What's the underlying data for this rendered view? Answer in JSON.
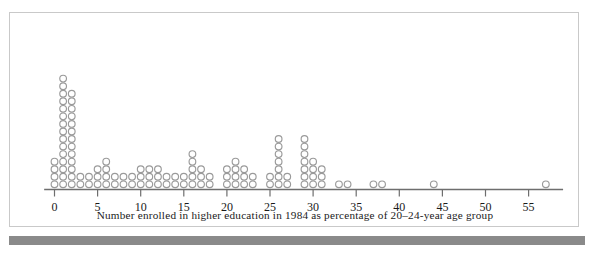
{
  "figure": {
    "caption": "Number enrolled in higher education in 1984 as percentage of 20–24-year age group",
    "frame_color": "#c9c9c9",
    "axis_color": "#6e6e6e",
    "dot_color": "#9a9a9a",
    "bottom_bar_color": "#8a8a8a",
    "background_color": "#ffffff"
  },
  "chart_data": {
    "type": "scatter",
    "plot_style": "dot-plot",
    "title": "",
    "subtitle": "",
    "xlabel": "Number enrolled in higher education in 1984 as percentage of 20–24-year age group",
    "ylabel": "",
    "xlim": [
      -1.2,
      59
    ],
    "ylim": [
      0,
      16
    ],
    "grid": false,
    "legend": null,
    "tick_labels": [
      "0",
      "5",
      "10",
      "15",
      "20",
      "25",
      "30",
      "35",
      "40",
      "45",
      "50",
      "55"
    ],
    "tick_values": [
      0,
      5,
      10,
      15,
      20,
      25,
      30,
      35,
      40,
      45,
      50,
      55
    ],
    "tick_interval": 5,
    "dot_unit": 1,
    "total_dots": 105,
    "categories": [
      0,
      1,
      2,
      3,
      4,
      5,
      6,
      7,
      8,
      9,
      10,
      11,
      12,
      13,
      14,
      15,
      16,
      17,
      18,
      19,
      20,
      21,
      22,
      23,
      24,
      25,
      26,
      27,
      28,
      29,
      30,
      31,
      32,
      33,
      34,
      35,
      36,
      37,
      38,
      39,
      40,
      41,
      42,
      43,
      44,
      45,
      46,
      47,
      48,
      49,
      50,
      51,
      52,
      53,
      54,
      55,
      56,
      57
    ],
    "values": [
      4,
      15,
      13,
      2,
      2,
      3,
      4,
      2,
      2,
      2,
      3,
      3,
      3,
      2,
      2,
      2,
      5,
      3,
      2,
      0,
      3,
      4,
      3,
      2,
      0,
      2,
      7,
      2,
      0,
      7,
      4,
      3,
      0,
      1,
      1,
      0,
      0,
      1,
      1,
      0,
      0,
      0,
      0,
      0,
      1,
      0,
      0,
      0,
      0,
      0,
      0,
      0,
      0,
      0,
      0,
      0,
      0,
      1
    ],
    "stacks": [
      {
        "x": 0,
        "count": 4
      },
      {
        "x": 1,
        "count": 15
      },
      {
        "x": 2,
        "count": 13
      },
      {
        "x": 3,
        "count": 2
      },
      {
        "x": 4,
        "count": 2
      },
      {
        "x": 5,
        "count": 3
      },
      {
        "x": 6,
        "count": 4
      },
      {
        "x": 7,
        "count": 2
      },
      {
        "x": 8,
        "count": 2
      },
      {
        "x": 9,
        "count": 2
      },
      {
        "x": 10,
        "count": 3
      },
      {
        "x": 11,
        "count": 3
      },
      {
        "x": 12,
        "count": 3
      },
      {
        "x": 13,
        "count": 2
      },
      {
        "x": 14,
        "count": 2
      },
      {
        "x": 15,
        "count": 2
      },
      {
        "x": 16,
        "count": 5
      },
      {
        "x": 17,
        "count": 3
      },
      {
        "x": 18,
        "count": 2
      },
      {
        "x": 20,
        "count": 3
      },
      {
        "x": 21,
        "count": 4
      },
      {
        "x": 22,
        "count": 3
      },
      {
        "x": 23,
        "count": 2
      },
      {
        "x": 25,
        "count": 2
      },
      {
        "x": 26,
        "count": 7
      },
      {
        "x": 27,
        "count": 2
      },
      {
        "x": 29,
        "count": 7
      },
      {
        "x": 30,
        "count": 4
      },
      {
        "x": 31,
        "count": 3
      },
      {
        "x": 33,
        "count": 1
      },
      {
        "x": 34,
        "count": 1
      },
      {
        "x": 37,
        "count": 1
      },
      {
        "x": 38,
        "count": 1
      },
      {
        "x": 44,
        "count": 1
      },
      {
        "x": 57,
        "count": 1
      }
    ]
  }
}
